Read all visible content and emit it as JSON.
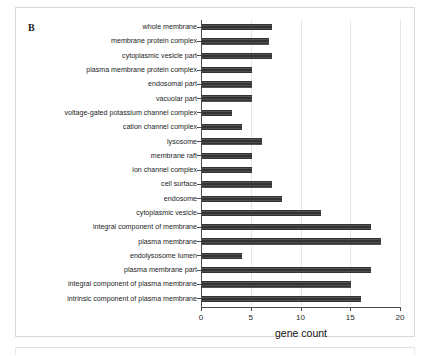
{
  "figure": {
    "panel_letter": "B"
  },
  "chart_data": {
    "type": "bar",
    "orientation": "horizontal",
    "title": "",
    "xlabel": "gene count",
    "ylabel": "",
    "xlim": [
      0,
      20
    ],
    "xticks": [
      0,
      5,
      10,
      15,
      20
    ],
    "xticklabels": [
      "0",
      "5",
      "10",
      "15",
      "20"
    ],
    "grid": "vertical",
    "legend": "none",
    "bar_color": "#333333",
    "categories": [
      "whole membrane",
      "membrane protein complex",
      "cytoplasmic vesicle part",
      "plasma membrane protein complex",
      "endosomal part",
      "vacuolar part",
      "voltage-gated potassium channel complex",
      "cation channel complex",
      "lysosome",
      "membrane raft",
      "ion channel complex",
      "cell surface",
      "endosome",
      "cytoplasmic vesicle",
      "integral component of membrane",
      "plasma membrane",
      "endolysosome lumen",
      "plasma membrane part",
      "integral component of plasma membrane",
      "intrinsic component of plasma membrane"
    ],
    "values": [
      7,
      6.7,
      7,
      5,
      5,
      5,
      3,
      4,
      6,
      5,
      5,
      7,
      8,
      12,
      17,
      18,
      4,
      17,
      15,
      16
    ]
  }
}
